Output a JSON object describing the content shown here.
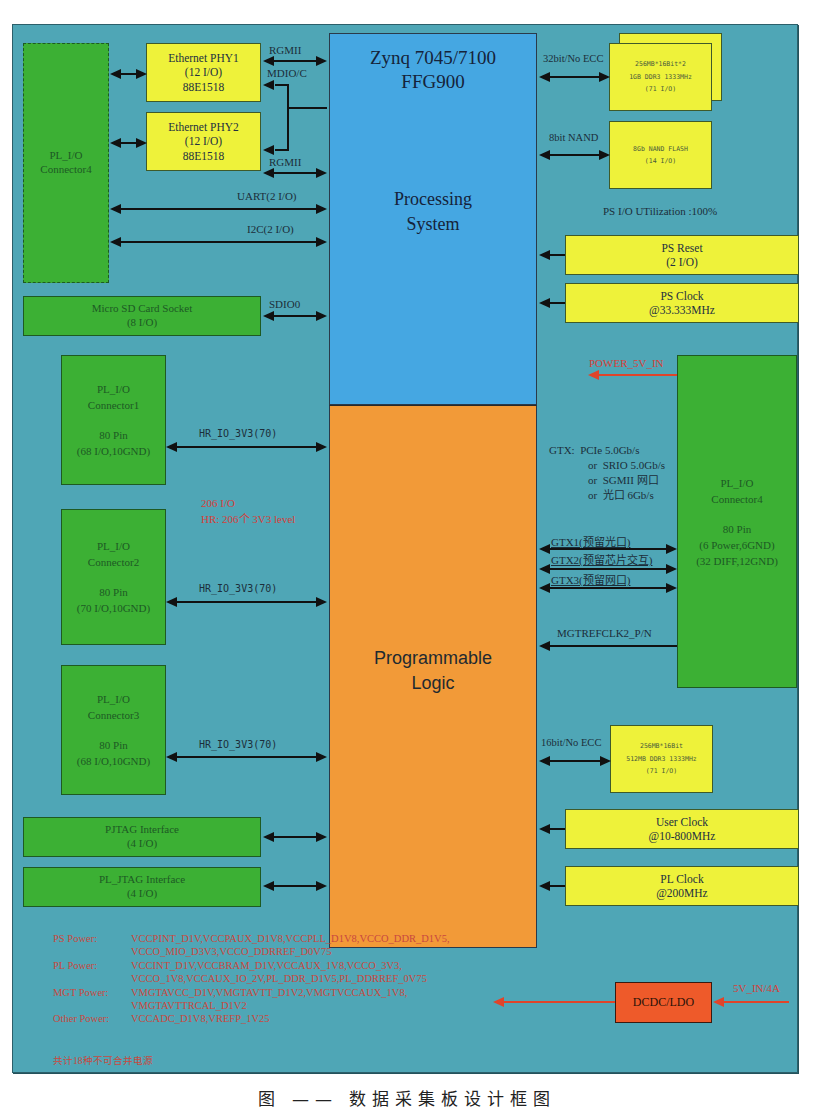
{
  "diagram": {
    "processing_system": {
      "title_line1": "Zynq 7045/7100",
      "title_line2": "FFG900",
      "label_line1": "Processing",
      "label_line2": "System",
      "color": "#45a7e2"
    },
    "programmable_logic": {
      "label_line1": "Programmable",
      "label_line2": "Logic",
      "color": "#f29a38"
    },
    "left_top_connector": {
      "line1": "PL_I/O",
      "line2": "Connector4"
    },
    "ethernet_phy1": {
      "line1": "Ethernet PHY1",
      "line2": "(12 I/O)",
      "line3": "88E1518"
    },
    "ethernet_phy2": {
      "line1": "Ethernet PHY2",
      "line2": "(12 I/O)",
      "line3": "88E1518"
    },
    "links_ps_left": {
      "rgmii1": "RGMII",
      "mdio": "MDIO/C",
      "rgmii2": "RGMII",
      "uart": "UART(2 I/O)",
      "i2c": "I2C(2 I/O)",
      "sdio": "SDIO0"
    },
    "micro_sd": {
      "line1": "Micro SD Card Socket",
      "line2": "(8 I/O)"
    },
    "ddr_ps": {
      "line1": "256MB*16Bit*2",
      "line2": "1GB DDR3 1333MHz",
      "line3": "(71 I/O)",
      "link": "32bit/No ECC"
    },
    "nand": {
      "line1": "8Gb NAND FLASH",
      "line2": "(14 I/O)",
      "link": "8bit NAND"
    },
    "ps_io_utilization": "PS I/O UTilization :100%",
    "ps_reset": {
      "line1": "PS Reset",
      "line2": "(2 I/O)"
    },
    "ps_clock": {
      "line1": "PS Clock",
      "line2": "@33.333MHz"
    },
    "power_5v_in": "POWER_5V_IN",
    "connector1": {
      "line1": "PL_I/O",
      "line2": "Connector1",
      "line3": "80 Pin",
      "line4": "(68 I/O,10GND)",
      "link": "HR_IO_3V3(70)"
    },
    "connector2": {
      "line1": "PL_I/O",
      "line2": "Connector2",
      "line3": "80 Pin",
      "line4": "(70 I/O,10GND)",
      "link": "HR_IO_3V3(70)"
    },
    "connector3": {
      "line1": "PL_I/O",
      "line2": "Connector3",
      "line3": "80 Pin",
      "line4": "(68 I/O,10GND)",
      "link": "HR_IO_3V3(70)"
    },
    "pl_io_note": {
      "line1": "206 I/O",
      "line2": "HR: 206个 3V3 level"
    },
    "gtx_note": {
      "line1": "GTX:  PCIe 5.0Gb/s",
      "line2": "or  SRIO 5.0Gb/s",
      "line3": "or  SGMII 网口",
      "line4": "or  光口 6Gb/s"
    },
    "right_connector4": {
      "line1": "PL_I/O",
      "line2": "Connector4",
      "line3": "80 Pin",
      "line4": "(6 Power,6GND)",
      "line5": "(32 DIFF,12GND)"
    },
    "gtx_links": {
      "gtx1": "GTX1(预留光口)",
      "gtx2": "GTX2(预留芯片交互)",
      "gtx3": "GTX3(预留网口)",
      "refclk": "MGTREFCLK2_P/N"
    },
    "ddr_pl": {
      "line1": "256MB*16Bit",
      "line2": "512MB DDR3 1333MHz",
      "line3": "(71 I/O)",
      "link": "16bit/No ECC"
    },
    "user_clock": {
      "line1": "User Clock",
      "line2": "@10-800MHz"
    },
    "pl_clock": {
      "line1": "PL Clock",
      "line2": "@200MHz"
    },
    "pjtag": {
      "line1": "PJTAG Interface",
      "line2": "(4 I/O)"
    },
    "pl_jtag": {
      "line1": "PL_JTAG Interface",
      "line2": "(4 I/O)"
    },
    "power": {
      "ps_label": "PS Power:",
      "ps_line1": "VCCPINT_D1V,VCCPAUX_D1V8,VCCPLL_D1V8,VCCO_DDR_D1V5,",
      "ps_line2": "VCCO_MIO_D3V3,VCCO_DDRREF_D0V75",
      "pl_label": "PL Power:",
      "pl_line1": "VCCINT_D1V,VCCBRAM_D1V,VCCAUX_1V8,VCCO_3V3,",
      "pl_line2": "VCCO_1V8,VCCAUX_IO_2V,PL_DDR_D1V5,PL_DDRREF_0V75",
      "mgt_label": "MGT Power:",
      "mgt_line1": "VMGTAVCC_D1V,VMGTAVTT_D1V2,VMGTVCCAUX_1V8,",
      "mgt_line2": "VMGTAVTTRCAL_D1V2",
      "other_label": "Other Power:",
      "other_line1": "VCCADC_D1V8,VREFP_1V25",
      "summary": "共计18种不可合并电源"
    },
    "dcdc": {
      "label": "DCDC/LDO",
      "input": "5V_IN/4A",
      "color": "#ee5a2a"
    },
    "caption": "图 —— 数据采集板设计框图"
  }
}
